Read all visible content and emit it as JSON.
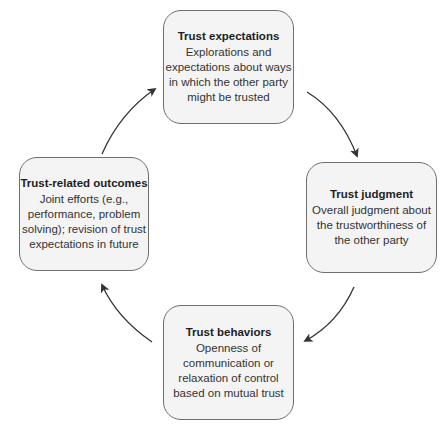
{
  "diagram": {
    "type": "cycle",
    "nodes": [
      {
        "id": "trust-expectations",
        "title": "Trust expectations",
        "lines": [
          "Explorations and",
          "expectations about ways",
          "in which the other party",
          "might be trusted"
        ]
      },
      {
        "id": "trust-judgment",
        "title": "Trust judgment",
        "lines": [
          "Overall judgment about",
          "the trustworthiness of",
          "the other party"
        ]
      },
      {
        "id": "trust-behaviors",
        "title": "Trust behaviors",
        "lines": [
          "Openness of",
          "communication or",
          "relaxation of control",
          "based on mutual trust"
        ]
      },
      {
        "id": "trust-related-outcomes",
        "title": "Trust-related outcomes",
        "lines": [
          "Joint efforts (e.g.,",
          "performance, problem",
          "solving); revision of trust",
          "expectations in future"
        ]
      }
    ],
    "edges": [
      {
        "from": "trust-expectations",
        "to": "trust-judgment"
      },
      {
        "from": "trust-judgment",
        "to": "trust-behaviors"
      },
      {
        "from": "trust-behaviors",
        "to": "trust-related-outcomes"
      },
      {
        "from": "trust-related-outcomes",
        "to": "trust-expectations"
      }
    ],
    "colors": {
      "box_fill": "#f4f4f4",
      "box_border": "#6e6e6e",
      "arrow": "#333333"
    }
  }
}
